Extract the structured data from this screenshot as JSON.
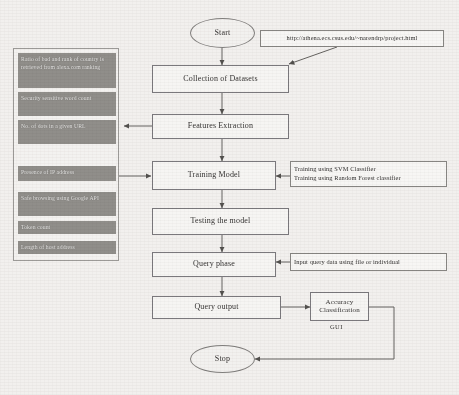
{
  "diagram": {
    "type": "flowchart",
    "background_color": "#f2f0ee",
    "feature_box_color": "#8e8c88",
    "line_color": "#6b6966"
  },
  "terminals": {
    "start": "Start",
    "stop": "Stop"
  },
  "flow_steps": [
    {
      "id": "collection",
      "label": "Collection of Datasets"
    },
    {
      "id": "features",
      "label": "Features Extraction"
    },
    {
      "id": "training",
      "label": "Training Model"
    },
    {
      "id": "testing",
      "label": "Testing the model"
    },
    {
      "id": "query_phase",
      "label": "Query phase"
    },
    {
      "id": "query_output",
      "label": "Query output"
    }
  ],
  "accuracy_node": {
    "line1": "Accuracy",
    "line2": "Classification",
    "caption": "GUI"
  },
  "notes": {
    "source_url": "http://athena.ecs.csus.edu/~narendrp/project.html",
    "classifiers": [
      "Training using SVM Classifier",
      "Training using Random Forest classifier"
    ],
    "query_input": "Input query data using file or individual"
  },
  "features_panel": {
    "items": [
      "Ratio of bad and rank of country is retrieved from alexa.com ranking",
      "Security sensitive word count",
      "No. of dots in a given URL",
      "Presence of IP address",
      "Safe browsing using Google API",
      "Token count",
      "Length of host address"
    ]
  }
}
